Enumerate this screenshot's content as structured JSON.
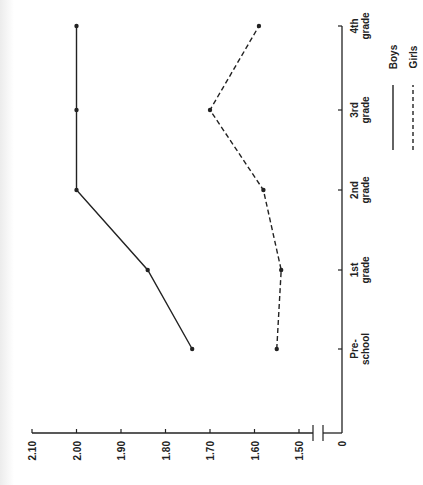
{
  "chart_data": {
    "type": "line",
    "orientation": "rotated 90° counter-clockwise (categories run bottom-to-top, values increase leftward)",
    "title": "",
    "xlabel": "",
    "ylabel": "",
    "categories": [
      "Pre-school",
      "1st grade",
      "2nd grade",
      "3rd grade",
      "4th grade"
    ],
    "category_labels": [
      [
        "Pre-",
        "school"
      ],
      [
        "1st",
        "grade"
      ],
      [
        "2nd",
        "grade"
      ],
      [
        "3rd",
        "grade"
      ],
      [
        "4th",
        "grade"
      ]
    ],
    "series": [
      {
        "name": "Boys",
        "style": "solid",
        "values": [
          1.74,
          1.84,
          2.0,
          2.0,
          2.0
        ]
      },
      {
        "name": "Girls",
        "style": "dashed",
        "values": [
          1.55,
          1.54,
          1.58,
          1.7,
          1.59
        ]
      }
    ],
    "value_ticks": [
      "2.10",
      "2.00",
      "1.90",
      "1.80",
      "1.70",
      "1.60",
      "1.50"
    ],
    "value_tick_numbers": [
      2.1,
      2.0,
      1.9,
      1.8,
      1.7,
      1.6,
      1.5
    ],
    "axis_zero_label": "0",
    "axis_break": true,
    "ylim": [
      1.5,
      2.1
    ],
    "grid": false,
    "legend": {
      "position": "right (rotated)",
      "entries": [
        {
          "label": "Boys",
          "style": "solid"
        },
        {
          "label": "Girls",
          "style": "dashed"
        }
      ]
    },
    "colors": {
      "line": "#222222",
      "axis": "#222222",
      "background": "#ffffff"
    }
  }
}
